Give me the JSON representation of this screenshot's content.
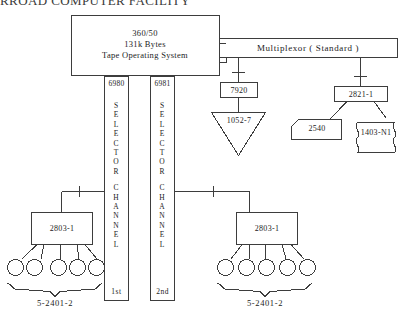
{
  "title": "RROAD COMPUTER FACILITY",
  "colors": {
    "stroke": "#3d3d3d",
    "text": "#1c1c1c",
    "background": "#ffffff"
  },
  "cpu": {
    "name": "central-processing-unit",
    "line1": "360/50",
    "line2": "131k Bytes",
    "line3": "Tape Operating System"
  },
  "multiplexor": {
    "name": "multiplexor-channel",
    "label": "Multiplexor ( Standard )"
  },
  "channels": [
    {
      "id": "6980",
      "words": [
        "SELECTOR",
        "CHANNEL"
      ],
      "order": "1st"
    },
    {
      "id": "6981",
      "words": [
        "SELECTOR",
        "CHANNEL"
      ],
      "order": "2nd"
    }
  ],
  "multiplexor_devices": [
    {
      "control_unit": "7920",
      "device": "1052-7",
      "device_shape": "triangle"
    },
    {
      "control_unit": "2821-1",
      "devices": [
        {
          "label": "2540",
          "shape": "punched-card"
        },
        {
          "label": "1403-N1",
          "shape": "printer"
        }
      ]
    }
  ],
  "tape_subsystems": [
    {
      "controller": "2803-1",
      "drive_count": 5,
      "brace_label": "5-2401-2",
      "attached_channel": "6980"
    },
    {
      "controller": "2803-1",
      "drive_count": 5,
      "brace_label": "5-2401-2",
      "attached_channel": "6981"
    }
  ]
}
